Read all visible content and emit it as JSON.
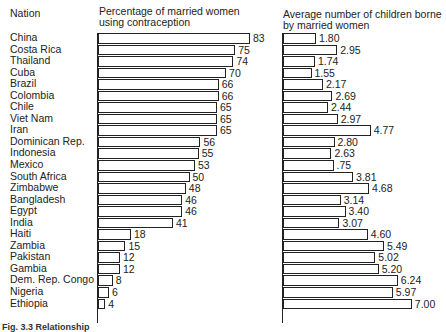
{
  "headers": {
    "nation": "Nation",
    "left": "Percentage of married women using contraception",
    "right": "Average number of children borne by married women"
  },
  "caption": "Fig. 3.3 Relationship",
  "chart_data": [
    {
      "type": "bar",
      "orientation": "horizontal",
      "title": "Percentage of married women using contraception",
      "categories": [
        "China",
        "Costa Rica",
        "Thailand",
        "Cuba",
        "Brazil",
        "Colombia",
        "Chile",
        "Viet Nam",
        "Iran",
        "Dominican Rep.",
        "Indonesia",
        "Mexico",
        "South Africa",
        "Zimbabwe",
        "Bangladesh",
        "Egypt",
        "India",
        "Haiti",
        "Zambia",
        "Pakistan",
        "Gambia",
        "Dem. Rep. Congo",
        "Nigeria",
        "Ethiopia"
      ],
      "values": [
        83,
        75,
        74,
        70,
        66,
        66,
        65,
        65,
        65,
        56,
        55,
        53,
        50,
        48,
        46,
        46,
        41,
        18,
        15,
        12,
        12,
        8,
        6,
        4
      ],
      "labels": [
        "83",
        "75",
        "74",
        "70",
        "66",
        "66",
        "65",
        "65",
        "65",
        "56",
        "55",
        "53",
        "50",
        "48",
        "46",
        "46",
        "41",
        "18",
        "15",
        "12",
        "12",
        "8",
        "6",
        "4"
      ],
      "xlabel": "",
      "ylabel": "Nation"
    },
    {
      "type": "bar",
      "orientation": "horizontal",
      "title": "Average number of children borne by married women",
      "categories": [
        "China",
        "Costa Rica",
        "Thailand",
        "Cuba",
        "Brazil",
        "Colombia",
        "Chile",
        "Viet Nam",
        "Iran",
        "Dominican Rep.",
        "Indonesia",
        "Mexico",
        "South Africa",
        "Zimbabwe",
        "Bangladesh",
        "Egypt",
        "India",
        "Haiti",
        "Zambia",
        "Pakistan",
        "Gambia",
        "Dem. Rep. Congo",
        "Nigeria",
        "Ethiopia"
      ],
      "values": [
        1.8,
        2.95,
        1.74,
        1.55,
        2.17,
        2.69,
        2.44,
        2.97,
        4.77,
        2.8,
        2.63,
        2.75,
        3.81,
        4.68,
        3.14,
        3.4,
        3.07,
        4.6,
        5.49,
        5.02,
        5.2,
        6.24,
        5.97,
        7.0
      ],
      "labels": [
        "1.80",
        "2.95",
        "1.74",
        "1.55",
        "2.17",
        "2.69",
        "2.44",
        "2.97",
        "4.77",
        "2.80",
        "2.63",
        ".75",
        "3.81",
        "4.68",
        "3.14",
        "3.40",
        "3.07",
        "4.60",
        "5.49",
        "5.02",
        "5.20",
        "6.24",
        "5.97",
        "7.00"
      ],
      "xlabel": "",
      "ylabel": ""
    }
  ]
}
